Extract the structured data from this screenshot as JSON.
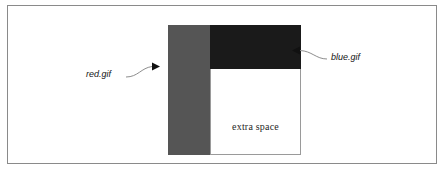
{
  "figure": {
    "kind": "image-layout-diagram",
    "frame_color": "#8a8a8a",
    "background": "#ffffff"
  },
  "blocks": {
    "red": {
      "name": "red.gif",
      "color": "#555555",
      "x": 160,
      "y": 19,
      "width": 42,
      "height": 130
    },
    "blue": {
      "name": "blue.gif",
      "color": "#1a1a1a",
      "x": 202,
      "y": 19,
      "width": 91,
      "height": 44
    },
    "extra_space": {
      "label": "extra space",
      "color": "#ffffff",
      "border_color": "#9a9a9a",
      "x": 202,
      "y": 63,
      "width": 91,
      "height": 86
    }
  },
  "callouts": [
    {
      "id": "red-callout",
      "label": "red.gif",
      "points_to": "red-block",
      "arrow_direction": "right"
    },
    {
      "id": "blue-callout",
      "label": "blue.gif",
      "points_to": "blue-block",
      "arrow_direction": "left"
    }
  ],
  "colors": {
    "red_block": "#555555",
    "blue_block": "#1a1a1a",
    "frame": "#8a8a8a",
    "leader_line": "#8d8d8d",
    "text": "#151515"
  }
}
